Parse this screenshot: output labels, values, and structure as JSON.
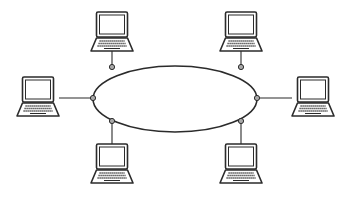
{
  "diagram": {
    "type": "ring-network-topology",
    "background": "#ffffff",
    "stroke_color": "#2b2b2b",
    "node_fill": "#a9a9a9",
    "ring": {
      "shape": "ellipse",
      "cx": 175,
      "cy": 99,
      "rx": 82,
      "ry": 33
    },
    "computers": [
      {
        "id": "laptop-top-left",
        "icon": "laptop-icon",
        "cx": 112,
        "top": 12,
        "node": {
          "x": 112,
          "y": 67
        },
        "connector": "vertical-down"
      },
      {
        "id": "laptop-top-right",
        "icon": "laptop-icon",
        "cx": 241,
        "top": 12,
        "node": {
          "x": 241,
          "y": 67
        },
        "connector": "vertical-down"
      },
      {
        "id": "laptop-left",
        "icon": "laptop-icon",
        "cx": 38,
        "top": 77,
        "node": {
          "x": 93,
          "y": 98
        },
        "connector": "horizontal-right"
      },
      {
        "id": "laptop-right",
        "icon": "laptop-icon",
        "cx": 313,
        "top": 77,
        "node": {
          "x": 257,
          "y": 98
        },
        "connector": "horizontal-left"
      },
      {
        "id": "laptop-bottom-left",
        "icon": "laptop-icon",
        "cx": 112,
        "top": 144,
        "node": {
          "x": 112,
          "y": 121
        },
        "connector": "vertical-up"
      },
      {
        "id": "laptop-bottom-right",
        "icon": "laptop-icon",
        "cx": 241,
        "top": 144,
        "node": {
          "x": 241,
          "y": 121
        },
        "connector": "vertical-up"
      }
    ]
  }
}
